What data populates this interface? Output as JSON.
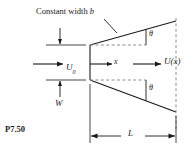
{
  "figure": {
    "problem_label": "P7.50",
    "title_note": "Constant width b",
    "title_note_plain": "Constant width ",
    "title_note_italic": "b",
    "labels": {
      "inlet_velocity": "U",
      "inlet_velocity_sub": "0",
      "axis": "x",
      "exit_velocity": "U(x)",
      "height": "W",
      "length": "L",
      "angle_upper": "θ",
      "angle_lower": "θ"
    },
    "colors": {
      "line": "#1a1a1a",
      "dashed": "#8c8c8c",
      "background": "#ffffff",
      "text": "#1a1a1a"
    },
    "icon_names": {
      "flow_arrow_inlet": "right-arrow-icon",
      "flow_arrow_exit": "right-arrow-icon",
      "axis_arrow": "right-arrow-icon",
      "leader": "leader-line",
      "dimension_width": "double-arrow-vertical-icon",
      "dimension_length": "double-arrow-horizontal-icon"
    },
    "geometry": {
      "throat_x": 90,
      "throat_top_y": 45,
      "throat_bottom_y": 80,
      "exit_x": 176,
      "exit_top_y": 21,
      "exit_bottom_y": 112,
      "centerline_y": 64,
      "dim_line_y": 136,
      "width_dim_x": 60
    }
  }
}
